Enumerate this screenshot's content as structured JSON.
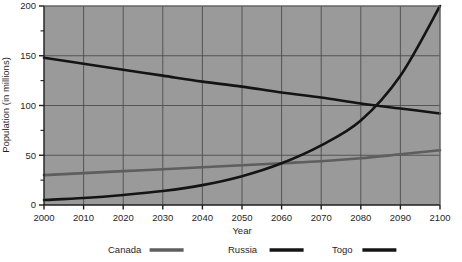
{
  "chart_data": {
    "type": "line",
    "title": "",
    "xlabel": "Year",
    "ylabel": "Population (in millions)",
    "xlim": [
      2000,
      2100
    ],
    "ylim": [
      0,
      200
    ],
    "grid": true,
    "legend_position": "bottom",
    "plot_background": "#9a9a9a",
    "gridline_color": "#4d4d4d",
    "x": [
      2000,
      2010,
      2020,
      2030,
      2040,
      2050,
      2060,
      2070,
      2080,
      2090,
      2100
    ],
    "xticklabels": [
      "2000",
      "2010",
      "2020",
      "2030",
      "2040",
      "2050",
      "2060",
      "2070",
      "2080",
      "2090",
      "2100"
    ],
    "yticks": [
      0,
      50,
      100,
      150,
      200
    ],
    "yticklabels": [
      "0",
      "50",
      "100",
      "150",
      "200"
    ],
    "yminorticks": [
      25,
      75,
      125,
      175
    ],
    "series": [
      {
        "name": "Canada",
        "color": "#5e5e5e",
        "values": [
          30,
          32,
          34,
          36,
          38,
          40,
          42,
          44,
          47,
          51,
          55
        ]
      },
      {
        "name": "Russia",
        "color": "#141414",
        "values": [
          148,
          142,
          136,
          130,
          124,
          119,
          113,
          108,
          102,
          97,
          92
        ]
      },
      {
        "name": "Togo",
        "color": "#141414",
        "values": [
          5,
          7,
          10,
          14,
          20,
          29,
          42,
          60,
          85,
          130,
          200
        ]
      }
    ]
  },
  "legend": {
    "entries": [
      {
        "label": "Canada",
        "color": "#5e5e5e"
      },
      {
        "label": "Russia",
        "color": "#141414"
      },
      {
        "label": "Togo",
        "color": "#141414"
      }
    ]
  }
}
